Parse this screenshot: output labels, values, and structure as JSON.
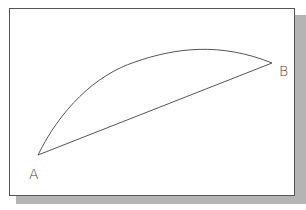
{
  "diagram": {
    "type": "arc-and-chord",
    "points": [
      {
        "id": "A",
        "label": "A",
        "x": 38,
        "y": 155
      },
      {
        "id": "B",
        "label": "B",
        "x": 272,
        "y": 63
      }
    ],
    "edges": [
      {
        "from": "A",
        "to": "B",
        "kind": "straight-line"
      },
      {
        "from": "A",
        "to": "B",
        "kind": "curved-arc"
      }
    ],
    "colors": {
      "line": "#555555",
      "frame_border": "#555555",
      "shadow": "#b4b4b4",
      "background": "#ffffff"
    }
  }
}
